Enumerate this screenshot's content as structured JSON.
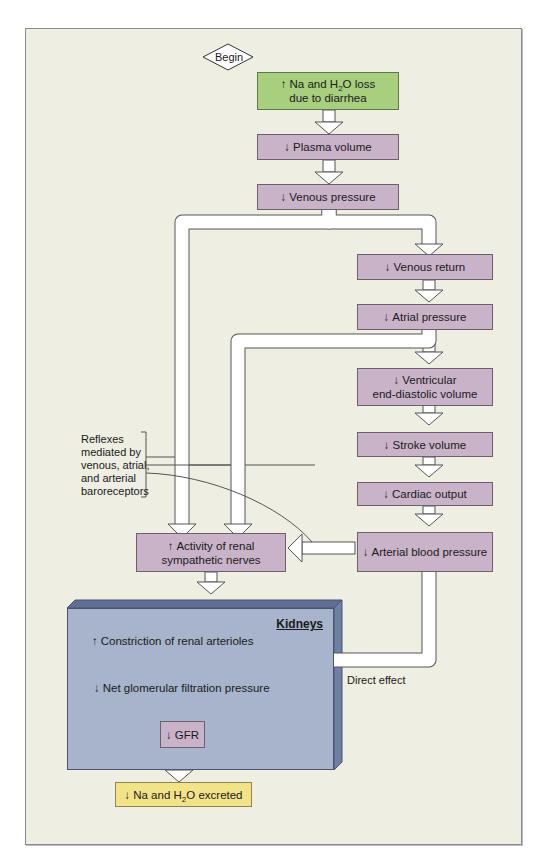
{
  "begin_label": "Begin",
  "nodes": {
    "start": {
      "arrow": "↑",
      "line1_pre": "Na and H",
      "sub": "2",
      "line1_post": "O loss",
      "line2": "due to diarrhea"
    },
    "plasma_volume": {
      "arrow": "↓",
      "label": "Plasma volume"
    },
    "venous_pressure": {
      "arrow": "↓",
      "label": "Venous pressure"
    },
    "venous_return": {
      "arrow": "↓",
      "label": "Venous return"
    },
    "atrial_pressure": {
      "arrow": "↓",
      "label": "Atrial pressure"
    },
    "ventricular_edv": {
      "arrow": "↓",
      "line1": "Ventricular",
      "line2": "end-diastolic volume"
    },
    "stroke_volume": {
      "arrow": "↓",
      "label": "Stroke volume"
    },
    "cardiac_output": {
      "arrow": "↓",
      "label": "Cardiac output"
    },
    "arterial_bp": {
      "arrow": "↓",
      "label": "Arterial blood pressure"
    },
    "renal_sympathetic": {
      "arrow": "↑",
      "line1": "Activity of renal",
      "line2": "sympathetic nerves"
    },
    "gfr": {
      "arrow": "↓",
      "label": "GFR"
    },
    "excreted": {
      "arrow": "↓",
      "pre": "Na and H",
      "sub": "2",
      "post": "O excreted"
    }
  },
  "kidneys": {
    "title": "Kidneys",
    "constriction": {
      "arrow": "↑",
      "label": "Constriction of renal arterioles"
    },
    "net_filtration": {
      "arrow": "↓",
      "label": "Net glomerular filtration pressure"
    }
  },
  "annotations": {
    "reflexes": [
      "Reflexes",
      "mediated by",
      "venous, atrial,",
      "and arterial",
      "baroreceptors"
    ],
    "direct_effect": "Direct effect"
  },
  "colors": {
    "background": "#eeeee2",
    "start_box": "#a8cf7e",
    "step_box": "#c9b3c9",
    "end_box": "#f2e389",
    "kidneys": "#a7b4cb",
    "kidneys_side": "#6e80a6"
  }
}
